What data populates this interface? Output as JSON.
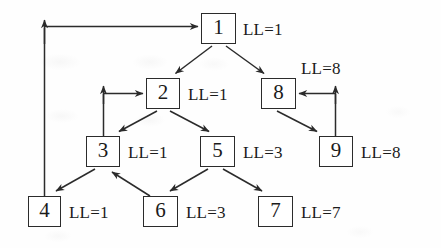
{
  "figure": {
    "kind": "directed-graph",
    "nodes": [
      {
        "id": "1",
        "label": "1",
        "ll_label": "LL=1",
        "x": 201,
        "y": 13,
        "w": 35,
        "h": 31,
        "ll_x": 243,
        "ll_y": 21
      },
      {
        "id": "2",
        "label": "2",
        "ll_label": "LL=1",
        "x": 146,
        "y": 78,
        "w": 34,
        "h": 31,
        "ll_x": 188,
        "ll_y": 86
      },
      {
        "id": "8",
        "label": "8",
        "ll_label": "LL=8",
        "x": 261,
        "y": 78,
        "w": 35,
        "h": 31,
        "ll_x": 301,
        "ll_y": 60
      },
      {
        "id": "3",
        "label": "3",
        "ll_label": "LL=1",
        "x": 86,
        "y": 136,
        "w": 34,
        "h": 31,
        "ll_x": 128,
        "ll_y": 144
      },
      {
        "id": "5",
        "label": "5",
        "ll_label": "LL=3",
        "x": 200,
        "y": 136,
        "w": 35,
        "h": 31,
        "ll_x": 243,
        "ll_y": 144
      },
      {
        "id": "9",
        "label": "9",
        "ll_label": "LL=8",
        "x": 319,
        "y": 136,
        "w": 34,
        "h": 31,
        "ll_x": 361,
        "ll_y": 144
      },
      {
        "id": "4",
        "label": "4",
        "ll_label": "LL=1",
        "x": 28,
        "y": 196,
        "w": 33,
        "h": 31,
        "ll_x": 69,
        "ll_y": 204
      },
      {
        "id": "6",
        "label": "6",
        "ll_label": "LL=3",
        "x": 143,
        "y": 196,
        "w": 35,
        "h": 31,
        "ll_x": 186,
        "ll_y": 204
      },
      {
        "id": "7",
        "label": "7",
        "ll_label": "LL=7",
        "x": 258,
        "y": 196,
        "w": 35,
        "h": 31,
        "ll_x": 301,
        "ll_y": 204
      }
    ],
    "edges": [
      {
        "from": "1",
        "to": "2",
        "kind": "tree"
      },
      {
        "from": "1",
        "to": "8",
        "kind": "tree"
      },
      {
        "from": "2",
        "to": "3",
        "kind": "tree"
      },
      {
        "from": "2",
        "to": "5",
        "kind": "tree"
      },
      {
        "from": "3",
        "to": "4",
        "kind": "tree"
      },
      {
        "from": "5",
        "to": "6",
        "kind": "tree"
      },
      {
        "from": "5",
        "to": "7",
        "kind": "tree"
      },
      {
        "from": "8",
        "to": "9",
        "kind": "tree"
      },
      {
        "from": "6",
        "to": "3",
        "kind": "back"
      },
      {
        "from": "3",
        "to": "2",
        "kind": "back-orthogonal"
      },
      {
        "from": "9",
        "to": "8",
        "kind": "back-orthogonal"
      },
      {
        "from": "4",
        "to": "1",
        "kind": "back-orthogonal-long"
      }
    ]
  },
  "style": {
    "stroke": "#2b2b2b",
    "background": "#fefefe",
    "text": "#1b1b1b"
  }
}
